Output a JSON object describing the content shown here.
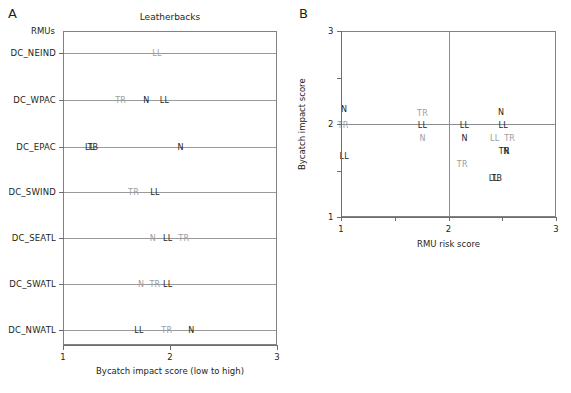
{
  "figure": {
    "panels": [
      {
        "letter": "A",
        "title": "Leatherbacks",
        "xlabel": "Bycatch impact score (low to high)",
        "xticks": [
          "1",
          "2",
          "3"
        ],
        "ylabel_header": "RMUs"
      },
      {
        "letter": "B",
        "xlabel": "RMU risk score",
        "ylabel": "Bycatch impact score",
        "xticks": [
          "1",
          "2",
          "3"
        ],
        "yticks": [
          "1",
          "2",
          "3"
        ]
      }
    ]
  },
  "chart_data": [
    {
      "type": "scatter",
      "panel": "A",
      "title": "Leatherbacks",
      "xlabel": "Bycatch impact score (low to high)",
      "ylabel": "RMUs",
      "xlim": [
        1,
        3
      ],
      "xticks": [
        1,
        2,
        3
      ],
      "grid": "horizontal-row-lines",
      "legend": "none",
      "categories": [
        "RMUs",
        "DC_NEIND",
        "DC_WPAC",
        "DC_EPAC",
        "DC_SWIND",
        "DC_SEATL",
        "DC_SWATL",
        "DC_NWATL"
      ],
      "points": [
        {
          "row": "DC_NEIND",
          "label": "LL",
          "x": 1.87,
          "shade": "light"
        },
        {
          "row": "DC_WPAC",
          "label": "TR",
          "x": 1.53,
          "shade": "light"
        },
        {
          "row": "DC_WPAC",
          "label": "N",
          "x": 1.77,
          "shade": "dark"
        },
        {
          "row": "DC_WPAC",
          "label": "LL",
          "x": 1.94,
          "shade": "dark"
        },
        {
          "row": "DC_EPAC",
          "label": "LL",
          "x": 1.24,
          "shade": "dark"
        },
        {
          "row": "DC_EPAC",
          "label": "TB",
          "x": 1.27,
          "shade": "dark"
        },
        {
          "row": "DC_EPAC",
          "label": "N",
          "x": 2.09,
          "shade": "dark"
        },
        {
          "row": "DC_SWIND",
          "label": "TR",
          "x": 1.65,
          "shade": "light"
        },
        {
          "row": "DC_SWIND",
          "label": "LL",
          "x": 1.85,
          "shade": "dark"
        },
        {
          "row": "DC_SEATL",
          "label": "N",
          "x": 1.83,
          "shade": "light"
        },
        {
          "row": "DC_SEATL",
          "label": "LL",
          "x": 1.97,
          "shade": "dark"
        },
        {
          "row": "DC_SEATL",
          "label": "TR",
          "x": 2.12,
          "shade": "light"
        },
        {
          "row": "DC_SWATL",
          "label": "N",
          "x": 1.72,
          "shade": "light"
        },
        {
          "row": "DC_SWATL",
          "label": "TR",
          "x": 1.85,
          "shade": "light"
        },
        {
          "row": "DC_SWATL",
          "label": "LL",
          "x": 1.97,
          "shade": "dark"
        },
        {
          "row": "DC_NWATL",
          "label": "LL",
          "x": 1.7,
          "shade": "dark"
        },
        {
          "row": "DC_NWATL",
          "label": "TR",
          "x": 1.96,
          "shade": "light"
        },
        {
          "row": "DC_NWATL",
          "label": "N",
          "x": 2.19,
          "shade": "dark"
        }
      ]
    },
    {
      "type": "scatter",
      "panel": "B",
      "title": "",
      "xlabel": "RMU risk score",
      "ylabel": "Bycatch impact score",
      "xlim": [
        1,
        3
      ],
      "ylim": [
        1,
        3
      ],
      "xticks": [
        1,
        2,
        3
      ],
      "yticks": [
        1,
        2,
        3
      ],
      "quadrant_lines": {
        "x": 2,
        "y": 2
      },
      "legend": "none",
      "points": [
        {
          "label": "N",
          "x": 1.02,
          "y": 2.17,
          "shade": "dark"
        },
        {
          "label": "TR",
          "x": 1.01,
          "y": 2.0,
          "shade": "light"
        },
        {
          "label": "LL",
          "x": 1.02,
          "y": 1.67,
          "shade": "dark"
        },
        {
          "label": "TR",
          "x": 1.75,
          "y": 2.13,
          "shade": "light"
        },
        {
          "label": "LL",
          "x": 1.75,
          "y": 2.0,
          "shade": "dark"
        },
        {
          "label": "N",
          "x": 1.75,
          "y": 1.86,
          "shade": "light"
        },
        {
          "label": "LL",
          "x": 2.14,
          "y": 2.0,
          "shade": "dark"
        },
        {
          "label": "N",
          "x": 2.14,
          "y": 1.86,
          "shade": "dark"
        },
        {
          "label": "TR",
          "x": 2.12,
          "y": 1.58,
          "shade": "light"
        },
        {
          "label": "N",
          "x": 2.48,
          "y": 2.14,
          "shade": "dark"
        },
        {
          "label": "LL",
          "x": 2.5,
          "y": 2.0,
          "shade": "dark"
        },
        {
          "label": "LL",
          "x": 2.42,
          "y": 1.86,
          "shade": "light"
        },
        {
          "label": "TR",
          "x": 2.56,
          "y": 1.86,
          "shade": "light"
        },
        {
          "label": "TR",
          "x": 2.51,
          "y": 1.72,
          "shade": "dark"
        },
        {
          "label": "N",
          "x": 2.53,
          "y": 1.72,
          "shade": "dark"
        },
        {
          "label": "LL",
          "x": 2.41,
          "y": 1.43,
          "shade": "dark"
        },
        {
          "label": "TB",
          "x": 2.44,
          "y": 1.43,
          "shade": "dark"
        }
      ]
    }
  ]
}
